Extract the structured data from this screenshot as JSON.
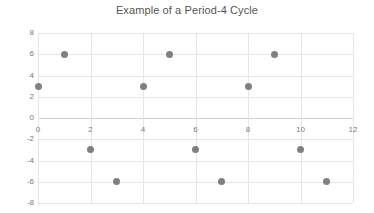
{
  "chart_data": {
    "type": "scatter",
    "title": "Example of a Period-4 Cycle",
    "xlabel": "",
    "ylabel": "",
    "x": [
      0,
      1,
      2,
      3,
      4,
      5,
      6,
      7,
      8,
      9,
      10,
      11
    ],
    "values": [
      3,
      6,
      -3,
      -6,
      3,
      6,
      -3,
      -6,
      3,
      6,
      -3,
      -6
    ],
    "series": [
      {
        "name": "",
        "values": [
          3,
          6,
          -3,
          -6,
          3,
          6,
          -3,
          -6,
          3,
          6,
          -3,
          -6
        ]
      }
    ],
    "xlim": [
      0,
      12
    ],
    "ylim": [
      -8,
      8
    ],
    "xticks": [
      "0",
      "2",
      "4",
      "6",
      "8",
      "10",
      "12"
    ],
    "xtick_values": [
      0,
      2,
      4,
      6,
      8,
      10,
      12
    ],
    "yticks": [
      "8",
      "6",
      "4",
      "2",
      "0",
      "-2",
      "-4",
      "-6",
      "-8"
    ],
    "ytick_values": [
      8,
      6,
      4,
      2,
      0,
      -2,
      -4,
      -6,
      -8
    ],
    "grid": true,
    "legend": false,
    "marker_color": "#808080",
    "grid_color": "#e6e6e6",
    "axis_color": "#d2d2d2",
    "title_color": "#555555",
    "tick_color": "#7a7a7a",
    "background": "#ffffff"
  }
}
